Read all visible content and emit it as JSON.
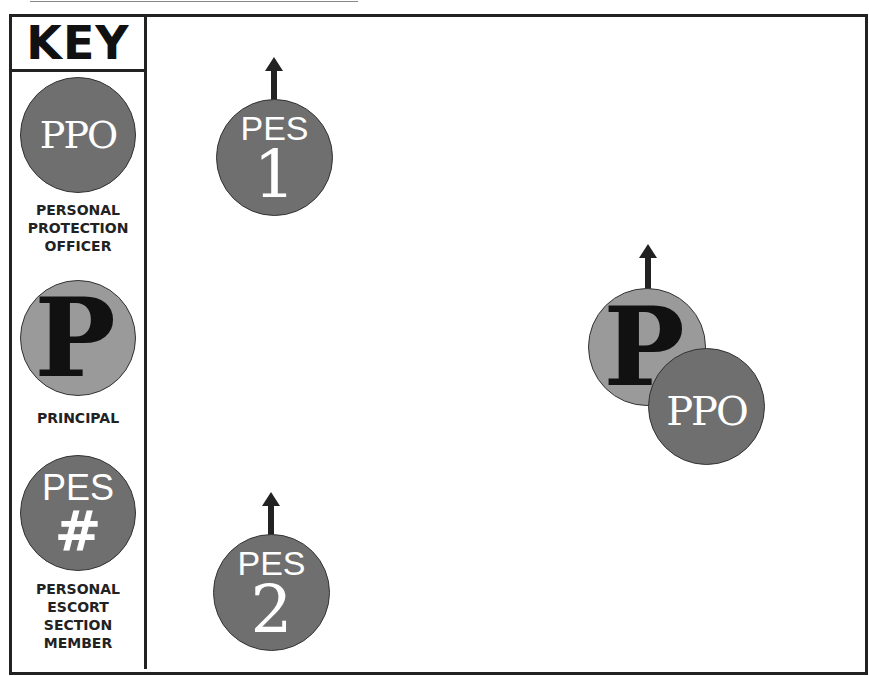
{
  "key": {
    "title": "KEY",
    "items": [
      {
        "symbol": "PPO",
        "label_lines": [
          "PERSONAL",
          "PROTECTION",
          "OFFICER"
        ]
      },
      {
        "symbol": "P",
        "label_lines": [
          "PRINCIPAL"
        ]
      },
      {
        "symbol_top": "PES",
        "symbol_bottom": "#",
        "label_lines": [
          "PERSONAL",
          "ESCORT",
          "SECTION",
          "MEMBER"
        ]
      }
    ]
  },
  "diagram": {
    "pes1": {
      "top": "PES",
      "number": "1",
      "direction": "up"
    },
    "pes2": {
      "top": "PES",
      "number": "2",
      "direction": "up"
    },
    "principal": {
      "symbol": "P",
      "direction": "up"
    },
    "ppo": {
      "symbol": "PPO"
    }
  },
  "colors": {
    "dark_circle": "#6f6f6f",
    "light_circle": "#9a9a9a",
    "line": "#222222"
  }
}
